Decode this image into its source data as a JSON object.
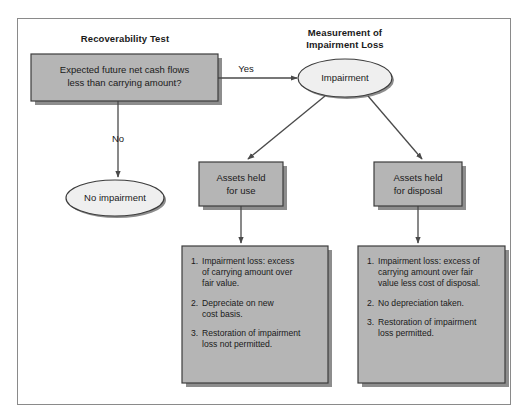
{
  "figure": {
    "title_left": "Recoverability Test",
    "title_right": "Measurement of\nImpairment Loss"
  },
  "colors": {
    "box_fill": "#b5b5b5",
    "box_stroke": "#3c3c3c",
    "ellipse_fill": "#efefef",
    "ellipse_stroke": "#3c3c3c",
    "shadow": "#8d8d8d",
    "frame_stroke": "#8a8a8a",
    "connector": "#4a4a4a",
    "text": "#1a1a1a"
  },
  "nodes": {
    "decision": {
      "label": "Expected future net cash flows\nless than carrying amount?",
      "shape": "rectangle"
    },
    "impairment": {
      "label": "Impairment",
      "shape": "ellipse"
    },
    "no_impairment": {
      "label": "No impairment",
      "shape": "ellipse"
    },
    "held_for_use": {
      "label": "Assets held\nfor use",
      "shape": "rectangle"
    },
    "held_for_disposal": {
      "label": "Assets held\nfor disposal",
      "shape": "rectangle"
    },
    "use_details": {
      "shape": "rectangle",
      "items": [
        {
          "num": "1.",
          "text": "Impairment loss: excess\nof carrying amount over\nfair value."
        },
        {
          "num": "2.",
          "text": "Depreciate on new\ncost basis."
        },
        {
          "num": "3.",
          "text": "Restoration of impairment\nloss not permitted."
        }
      ]
    },
    "disposal_details": {
      "shape": "rectangle",
      "items": [
        {
          "num": "1.",
          "text": "Impairment loss: excess of\ncarrying amount over fair\nvalue less cost of disposal."
        },
        {
          "num": "2.",
          "text": "No depreciation taken."
        },
        {
          "num": "3.",
          "text": "Restoration of impairment\nloss permitted."
        }
      ]
    }
  },
  "edges": {
    "yes_label": "Yes",
    "no_label": "No"
  }
}
